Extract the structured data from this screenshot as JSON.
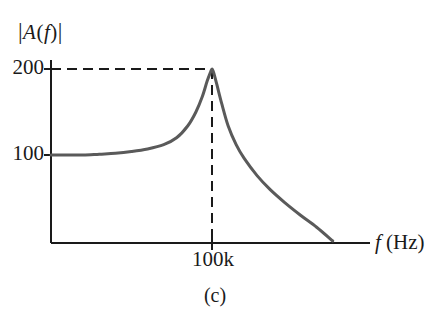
{
  "figure": {
    "caption": "(c)",
    "background_color": "#ffffff",
    "curve_color": "#5a5a5a",
    "axis_color": "#1a1a1a",
    "text_color": "#1a1a1a"
  },
  "axes": {
    "y_title_parts": {
      "open_bar": "|",
      "a": "A",
      "open_paren": "(",
      "f": "f",
      "close_paren": ")",
      "close_bar": "|"
    },
    "y_title_plain": "|A(f)|",
    "x_title_parts": {
      "f": "f",
      "unit": "(Hz)"
    },
    "x_title_plain": "f (Hz)",
    "y_ticks": [
      "200",
      "100"
    ],
    "x_ticks": [
      "100k"
    ]
  },
  "chart_data": {
    "type": "line",
    "title": "",
    "subtitle": "",
    "caption": "(c)",
    "xlabel": "f (Hz)",
    "ylabel": "|A(f)|",
    "grid": false,
    "legend": null,
    "x_tick_labels": [
      "100k"
    ],
    "x_tick_values": [
      100000
    ],
    "y_tick_labels": [
      "100",
      "200"
    ],
    "y_tick_values": [
      100,
      200
    ],
    "xlim": [
      0,
      230000
    ],
    "ylim": [
      0,
      240
    ],
    "annotations": [
      {
        "type": "dashed-line",
        "orientation": "horizontal",
        "value": 200,
        "from_x": 0,
        "to_x": 100000
      },
      {
        "type": "dashed-line",
        "orientation": "vertical",
        "value": 100000,
        "from_y": 0,
        "to_y": 200
      }
    ],
    "series": [
      {
        "name": "|A(f)|",
        "color": "#5a5a5a",
        "description": "Low-frequency gain plateau at 100, resonant peak of 200 at 100k Hz, then rapid roll-off to zero",
        "x": [
          0,
          5000,
          10000,
          20000,
          30000,
          40000,
          50000,
          60000,
          70000,
          78000,
          85000,
          90000,
          94000,
          97000,
          99000,
          100000,
          101000,
          103000,
          106000,
          110000,
          115000,
          120000,
          128000,
          136000,
          145000,
          155000,
          165000,
          175000
        ],
        "y": [
          100,
          100,
          100,
          100,
          101,
          102,
          104,
          107,
          112,
          120,
          134,
          150,
          168,
          186,
          196,
          200,
          196,
          182,
          160,
          134,
          112,
          96,
          76,
          60,
          45,
          30,
          16,
          0
        ]
      }
    ]
  }
}
